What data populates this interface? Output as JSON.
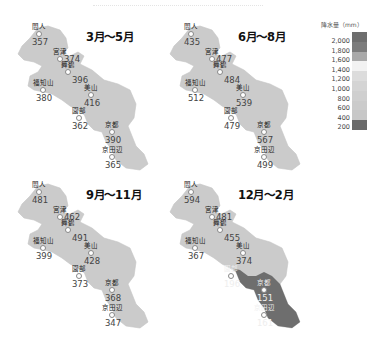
{
  "legend": {
    "title": "降水量（mm）",
    "ticks": [
      "2,000",
      "1,800",
      "1,600",
      "1,400",
      "1,200",
      "1,000",
      "800",
      "600",
      "400",
      "200"
    ],
    "bands": [
      {
        "range": "1,800-2,000+",
        "color": "#6e6e6e"
      },
      {
        "range": "1,600-1,800",
        "color": "#7c7c7c"
      },
      {
        "range": "1,400-1,600",
        "color": "#a9a9a9"
      },
      {
        "range": "1,200-1,400",
        "color": "#f2f2f2"
      },
      {
        "range": "1,000-1,200",
        "color": "#dcdcdc"
      },
      {
        "range": "800-1,000",
        "color": "#d4d4d4"
      },
      {
        "range": "600-800",
        "color": "#cfcfcf"
      },
      {
        "range": "400-600",
        "color": "#cbcbcb"
      },
      {
        "range": "200-400",
        "color": "#c7c7c7"
      },
      {
        "range": "0-200",
        "color": "#6a6a6a"
      }
    ]
  },
  "panels": [
    {
      "title": "3月〜5月",
      "fill": "#cbcbcb",
      "stations": [
        {
          "name": "間人",
          "value": "357"
        },
        {
          "name": "宮津",
          "value": "374"
        },
        {
          "name": "舞鶴",
          "value": "396"
        },
        {
          "name": "福知山",
          "value": "380"
        },
        {
          "name": "美山",
          "value": "416"
        },
        {
          "name": "園部",
          "value": "362"
        },
        {
          "name": "京都",
          "value": "390"
        },
        {
          "name": "京田辺",
          "value": "365"
        }
      ]
    },
    {
      "title": "6月〜8月",
      "fill": "#cbcbcb",
      "stations": [
        {
          "name": "間人",
          "value": "435"
        },
        {
          "name": "宮津",
          "value": "477"
        },
        {
          "name": "舞鶴",
          "value": "484"
        },
        {
          "name": "福知山",
          "value": "512"
        },
        {
          "name": "美山",
          "value": "539"
        },
        {
          "name": "園部",
          "value": "479"
        },
        {
          "name": "京都",
          "value": "567"
        },
        {
          "name": "京田辺",
          "value": "499"
        }
      ]
    },
    {
      "title": "9月〜11月",
      "fill": "#cbcbcb",
      "stations": [
        {
          "name": "間人",
          "value": "481"
        },
        {
          "name": "宮津",
          "value": "462"
        },
        {
          "name": "舞鶴",
          "value": "491"
        },
        {
          "name": "福知山",
          "value": "399"
        },
        {
          "name": "美山",
          "value": "428"
        },
        {
          "name": "園部",
          "value": "373"
        },
        {
          "name": "京都",
          "value": "368"
        },
        {
          "name": "京田辺",
          "value": "347"
        }
      ]
    },
    {
      "title": "12月〜2月",
      "fill": "#cbcbcb",
      "south_fill": "#6e6e6e",
      "stations": [
        {
          "name": "間人",
          "value": "594"
        },
        {
          "name": "宮津",
          "value": "481"
        },
        {
          "name": "舞鶴",
          "value": "455"
        },
        {
          "name": "福知山",
          "value": "367"
        },
        {
          "name": "美山",
          "value": "374"
        },
        {
          "name": "園部",
          "value": "196",
          "value_legible": false
        },
        {
          "name": "京都",
          "value": "151",
          "value_legible": false
        },
        {
          "name": "京田辺",
          "value": "161",
          "value_legible": false
        }
      ]
    }
  ]
}
